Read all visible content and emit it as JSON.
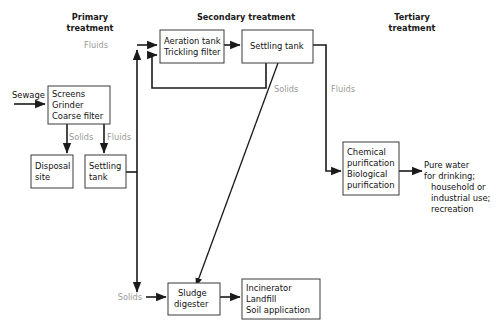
{
  "diagram": {
    "colors": {
      "background": "#ffffff",
      "box_stroke": "#3a3a3a",
      "connector": "#1a1a1a",
      "flow_label": "#9a9a9a",
      "text": "#111111"
    },
    "sections": [
      {
        "id": "primary",
        "line1": "Primary",
        "line2": "treatment"
      },
      {
        "id": "secondary",
        "line1": "Secondary treatment",
        "line2": ""
      },
      {
        "id": "tertiary",
        "line1": "Tertiary",
        "line2": "treatment"
      }
    ],
    "boxes": [
      {
        "id": "screens",
        "lines": [
          "Screens",
          "Grinder",
          "Coarse filter"
        ]
      },
      {
        "id": "disposal-site",
        "lines": [
          "Disposal",
          "site"
        ]
      },
      {
        "id": "settling-tank-primary",
        "lines": [
          "Settling",
          "tank"
        ]
      },
      {
        "id": "aeration-tank",
        "lines": [
          "Aeration tank",
          "Trickling filter"
        ]
      },
      {
        "id": "settling-tank-secondary",
        "lines": [
          "Settling tank"
        ]
      },
      {
        "id": "purification",
        "lines": [
          "Chemical",
          "purification",
          "Biological",
          "purification"
        ]
      },
      {
        "id": "sludge-digester",
        "lines": [
          "Sludge",
          "digester"
        ]
      },
      {
        "id": "disposal-methods",
        "lines": [
          "Incinerator",
          "Landfill",
          "Soil application"
        ]
      }
    ],
    "inputs": [
      {
        "id": "sewage",
        "label": "Sewage"
      }
    ],
    "outputs": [
      {
        "id": "pure-water",
        "lines": [
          "Pure water",
          "for drinking;",
          "household or",
          "industrial use;",
          "recreation"
        ]
      }
    ],
    "flow_labels": [
      {
        "id": "solids-primary",
        "text": "Solids"
      },
      {
        "id": "fluids-primary",
        "text": "Fluids"
      },
      {
        "id": "fluids-to-aeration",
        "text": "Fluids"
      },
      {
        "id": "solids-secondary",
        "text": "Solids"
      },
      {
        "id": "fluids-to-tertiary",
        "text": "Fluids"
      },
      {
        "id": "solids-to-digester",
        "text": "Solids"
      }
    ]
  }
}
